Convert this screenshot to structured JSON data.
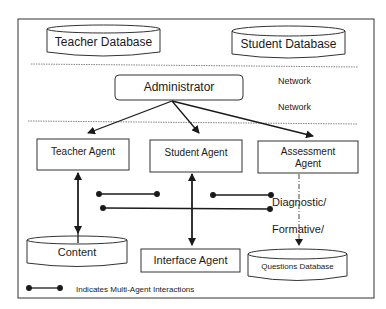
{
  "diagram": {
    "databases": {
      "teacher": "Teacher Database",
      "student": "Student Database",
      "content": "Content",
      "questions": "Questions Database"
    },
    "network_labels": [
      "Network",
      "Network"
    ],
    "administrator": "Administrator",
    "agents": {
      "teacher": "Teacher Agent",
      "student": "Student Agent",
      "assessment_line1": "Assessment",
      "assessment_line2": "Agent",
      "interface": "Interface Agent"
    },
    "annotations": {
      "diagnostic": "Diagnostic/",
      "formative": "Formative/"
    },
    "legend": {
      "text": "Indicates Multi-Agent Interactions"
    }
  }
}
